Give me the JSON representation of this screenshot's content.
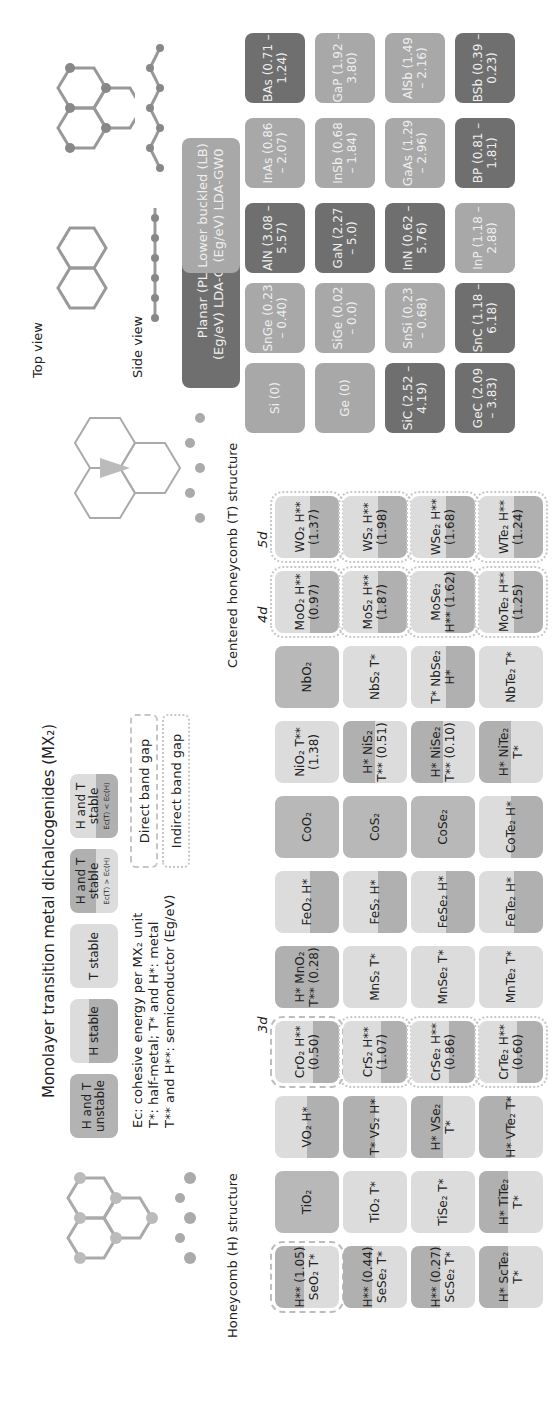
{
  "title": "Monolayer transition metal dichalcogenides (MX₂)",
  "legend": {
    "items": [
      {
        "label": "H and T unstable",
        "key": "un"
      },
      {
        "label": "H stable",
        "key": "h"
      },
      {
        "label": "T stable",
        "key": "t"
      },
      {
        "label": "H and T stable",
        "sub": "Ec(T) > Ec(H)",
        "key": "ht1"
      },
      {
        "label": "H and T stable",
        "sub": "Ec(T) < Ec(H)",
        "key": "ht2"
      }
    ],
    "direct_gap": "Direct band gap",
    "indirect_gap": "Indirect band gap",
    "notes": [
      "Ec: cohesive energy per MX₂ unit",
      "T*: half-metal; T* and H*: metal",
      "T** and H**: semiconductor (Eg/eV)"
    ]
  },
  "structures": {
    "h_label": "Honeycomb (H) structure",
    "t_label": "Centered honeycomb (T) structure",
    "top_view": "Top view",
    "side_view": "Side view"
  },
  "period_labels": {
    "d3": "3d",
    "d4": "4d",
    "d5": "5d"
  },
  "tmd_columns": [
    "Sc",
    "Ti",
    "V",
    "Cr",
    "Mn",
    "Fe",
    "Co",
    "Ni",
    "Nb",
    "Mo",
    "W"
  ],
  "tmd_rows": [
    "O",
    "S",
    "Se",
    "Te"
  ],
  "tmd_tiles": [
    [
      "H** (1.05) SeO₂ T*",
      "H** (0.44) SeSe₂ T*",
      "H** (0.27) ScSe₂ T*",
      "H* ScTe₂ T*"
    ],
    [
      "TiO₂",
      "TiO₂ T*",
      "TiSe₂ T*",
      "H* TiTe₂ T*"
    ],
    [
      "VO₂ H*",
      "T* VS₂ H*",
      "H* VSe₂ T*",
      "H* VTe₂ T*"
    ],
    [
      "CrO₂ H** (0.50)",
      "CrS₂ H** (1.07)",
      "CrSe₂ H** (0.86)",
      "CrTe₂ H** (0.60)"
    ],
    [
      "H* MnO₂ T** (0.28)",
      "MnS₂ T*",
      "MnSe₂ T*",
      "MnTe₂ T*"
    ],
    [
      "FeO₂ H*",
      "FeS₂ H*",
      "FeSe₂ H*",
      "FeTe₂ H*"
    ],
    [
      "CoO₂",
      "CoS₂",
      "CoSe₂",
      "CoTe₂ H*"
    ],
    [
      "NiO₂ T** (1.38)",
      "H* NiS₂ T** (0.51)",
      "H* NiSe₂ T** (0.10)",
      "H* NiTe₂ T*"
    ],
    [
      "NbO₂",
      "NbS₂ T*",
      "T* NbSe₂ H*",
      "NbTe₂ T*"
    ],
    [
      "MoO₂ H** (0.97)",
      "MoS₂ H** (1.87)",
      "MoSe₂ H** (1.62)",
      "MoTe₂ H** (1.25)"
    ],
    [
      "WO₂ H** (1.37)",
      "WS₂ H** (1.98)",
      "WSe₂ H** (1.68)",
      "WTe₂ H** (1.24)"
    ]
  ],
  "group4": {
    "planar_header": [
      "Planar (PL)",
      "(Eg/eV) LDA-GW0"
    ],
    "buckled_header": [
      "Lower buckled (LB)",
      "(Eg/eV) LDA-GW0"
    ],
    "columns": [
      [
        "Si (0)",
        "Ge (0)",
        "SiC (2.52 – 4.19)",
        "GeC (2.09 – 3.83)"
      ],
      [
        "SnGe (0.23 – 0.40)",
        "SiGe (0.02 – 0.0)",
        "SnSi (0.23 – 0.68)",
        "SnC (1.18 – 6.18)"
      ],
      [
        "AlN (3.08 – 5.57)",
        "GaN (2.27 – 5.0)",
        "InN (0.62 – 5.76)",
        "InP (1.18 – 2.88)"
      ],
      [
        "InAs (0.86 – 2.07)",
        "InSb (0.68 – 1.84)",
        "GaAs (1.29 – 2.96)",
        "BP (0.81 – 1.81)"
      ],
      [
        "BAs (0.71 – 1.24)",
        "GaP (1.92 – 3.80)",
        "AlSb (1.49 – 2.16)",
        "BSb (0.39 – 0.23)"
      ]
    ]
  },
  "colors": {
    "dark": "#6f6f6f",
    "mid": "#959595",
    "light": "#a8a8a8",
    "t_stable": "#dcdcdc",
    "h_stable": "#b0b0b0"
  }
}
